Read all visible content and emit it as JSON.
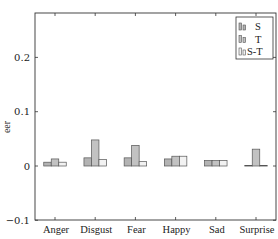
{
  "chart_data": {
    "type": "bar",
    "title": "",
    "xlabel": "",
    "ylabel": "eer",
    "ylim": [
      -0.1,
      0.28
    ],
    "yticks": [
      -0.1,
      0,
      0.1,
      0.2
    ],
    "ytick_labels": [
      "−0.1",
      "0",
      "0.1",
      "0.2"
    ],
    "grid": false,
    "legend_position": "upper right",
    "categories": [
      "Anger",
      "Disgust",
      "Fear",
      "Happy",
      "Sad",
      "Surprise"
    ],
    "series": [
      {
        "name": "S",
        "color": "#b3b3b3",
        "values": [
          0.007,
          0.015,
          0.015,
          0.013,
          0.01,
          0.001
        ]
      },
      {
        "name": "T",
        "color": "#c2c2c2",
        "values": [
          0.013,
          0.048,
          0.038,
          0.018,
          0.01,
          0.031
        ]
      },
      {
        "name": "S-T",
        "color": "#f2f2f2",
        "values": [
          0.007,
          0.012,
          0.008,
          0.018,
          0.01,
          0.001
        ]
      }
    ]
  },
  "colors": {
    "axis": "#333333",
    "bar_outline": "#555555"
  }
}
